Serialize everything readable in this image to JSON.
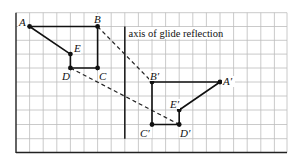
{
  "diagram": {
    "axis_label": "axis of glide reflection",
    "points": {
      "A": "A",
      "B": "B",
      "C": "C",
      "D": "D",
      "E": "E",
      "A_prime": "A′",
      "B_prime": "B′",
      "C_prime": "C′",
      "D_prime": "D′",
      "E_prime": "E′"
    },
    "grid": {
      "columns": 20,
      "rows": 10
    },
    "colors": {
      "grid": "#b8b8b8",
      "ink": "#111111"
    }
  }
}
